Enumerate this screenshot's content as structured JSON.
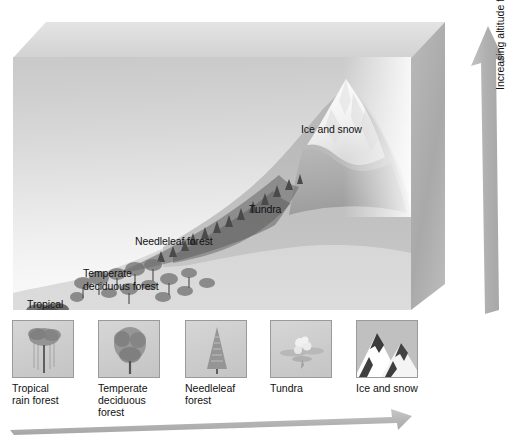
{
  "figure": {
    "type": "altitudinal-vegetation-zones-diagram",
    "scene_labels": [
      {
        "id": "ice-and-snow",
        "text": "Ice and snow"
      },
      {
        "id": "tundra",
        "text": "Tundra"
      },
      {
        "id": "needleleaf-forest",
        "text": "Needleleaf forest"
      },
      {
        "id": "temperate-deciduous",
        "text": "Temperate\ndeciduous forest"
      },
      {
        "id": "tropical-rain",
        "text": "Tropical\nrain forest"
      }
    ],
    "altitude_axis": {
      "label": "Increasing altitude from sea level",
      "direction": "up",
      "arrow_icon": "up-arrow-icon"
    },
    "horizontal_axis": {
      "arrow_icon": "right-arrow-icon"
    },
    "legend": {
      "items": [
        {
          "id": "tropical-rain-forest",
          "caption": "Tropical\nrain forest",
          "icon": "broadleaf-tree-icon"
        },
        {
          "id": "temperate-deciduous-forest",
          "caption": "Temperate\ndeciduous\nforest",
          "icon": "deciduous-tree-icon"
        },
        {
          "id": "needleleaf-forest",
          "caption": "Needleleaf\nforest",
          "icon": "conifer-tree-icon"
        },
        {
          "id": "tundra",
          "caption": "Tundra",
          "icon": "tundra-flower-icon"
        },
        {
          "id": "ice-and-snow",
          "caption": "Ice and snow",
          "icon": "snowy-mountain-icon"
        }
      ]
    },
    "colors": {
      "sky_top": "#c9c9c9",
      "sky_bottom": "#fbfbfb",
      "arrow_gray": "#b0b0b0",
      "block_top_face": "#dcdcdc",
      "block_right_face": "#b0b0b0",
      "text": "#111111"
    }
  }
}
